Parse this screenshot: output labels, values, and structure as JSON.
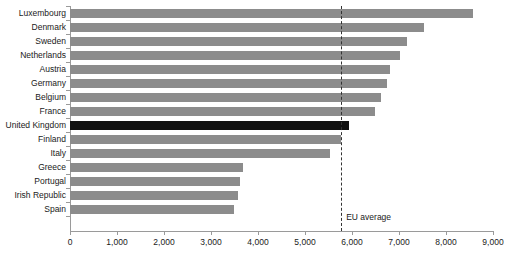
{
  "chart_data": {
    "type": "bar",
    "orientation": "horizontal",
    "title": "",
    "subtitle": "",
    "xlabel": "",
    "ylabel": "",
    "xlim": [
      0,
      9000
    ],
    "ylim": null,
    "grid": false,
    "legend": null,
    "categories": [
      "Luxembourg",
      "Denmark",
      "Sweden",
      "Netherlands",
      "Austria",
      "Germany",
      "Belgium",
      "France",
      "United Kingdom",
      "Finland",
      "Italy",
      "Greece",
      "Portugal",
      "Irish Republic",
      "Spain"
    ],
    "values": [
      8570,
      7530,
      7170,
      7020,
      6810,
      6740,
      6620,
      6490,
      5940,
      5770,
      5530,
      3680,
      3620,
      3570,
      3490
    ],
    "highlight_category": "United Kingdom",
    "colors": {
      "bar": "#8c8c8c",
      "bar_highlight": "#111111",
      "axis": "#9a9a9a",
      "text": "#1a1a1a",
      "reference_line": "#333333",
      "background": "#ffffff"
    },
    "xticks": [
      0,
      1000,
      2000,
      3000,
      4000,
      5000,
      6000,
      7000,
      8000,
      9000
    ],
    "xtick_labels": [
      "0",
      "1,000",
      "2,000",
      "3,000",
      "4,000",
      "5,000",
      "6,000",
      "7,000",
      "8,000",
      "9,000"
    ],
    "annotations": [
      {
        "name": "eu-average",
        "label": "EU average",
        "value": 5770,
        "style": "dashed-vertical-line"
      }
    ]
  }
}
